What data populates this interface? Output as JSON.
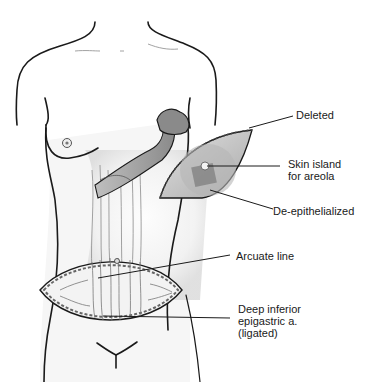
{
  "figure": {
    "labels": {
      "deleted": "Deleted",
      "skin_island": "Skin island\nfor areola",
      "de_epithelialized": "De-epithelialized",
      "arcuate_line": "Arcuate line",
      "deep_inferior": "Deep inferior\nepigastric a.\n(ligated)"
    },
    "colors": {
      "outline": "#1a1a1a",
      "flap_fill": "#cfcfcf",
      "flap_dark": "#9a9a9a",
      "muscle": "#bdbdbd",
      "skin_shade": "#e6e6e6"
    }
  }
}
